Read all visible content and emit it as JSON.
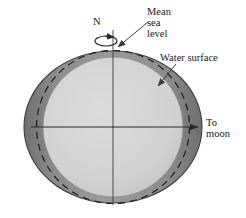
{
  "figure": {
    "type": "schematic-diagram",
    "width": 246,
    "height": 218,
    "background_color": "#ffffff"
  },
  "labels": {
    "mean_sea_level": "Mean\nsea\nlevel",
    "water_surface": "Water surface",
    "to_moon": "To\nmoon",
    "north_pole": "N"
  },
  "colors": {
    "water_band": "#8a8a8a",
    "water_band_dark": "#6f6f6f",
    "solid_earth": "#d2d2d2",
    "outline": "#3a3a3a",
    "dashed_line": "#1a1a1a",
    "leader_line": "#4a4a4a",
    "text": "#1a1a1a"
  },
  "geometry": {
    "center_x": 113,
    "center_y": 127,
    "water_surface_rx": 89,
    "water_surface_ry": 76,
    "mean_sea_level_r": 76,
    "solid_earth_r": 70,
    "rotation_axis_top_y": 30,
    "rotation_axis_bottom_y": 203,
    "equator_y": 127,
    "moon_arrow_tip_x": 199,
    "rotation_ellipse_rx": 11,
    "rotation_ellipse_ry": 5,
    "rotation_ellipse_cy": 41
  },
  "elements": {
    "solid_earth": "light-gray filled circle representing the solid Earth",
    "water_layer": "dark-gray elliptical shell representing the water surface bulged toward the moon",
    "mean_sea_level_circle": "dashed circle marking the undisturbed mean sea level",
    "rotation_axis": "vertical line through the poles",
    "rotation_arrow": "small ellipse with arrowhead showing Earth's spin direction",
    "equator_line": "horizontal line through the center pointing to the moon"
  }
}
